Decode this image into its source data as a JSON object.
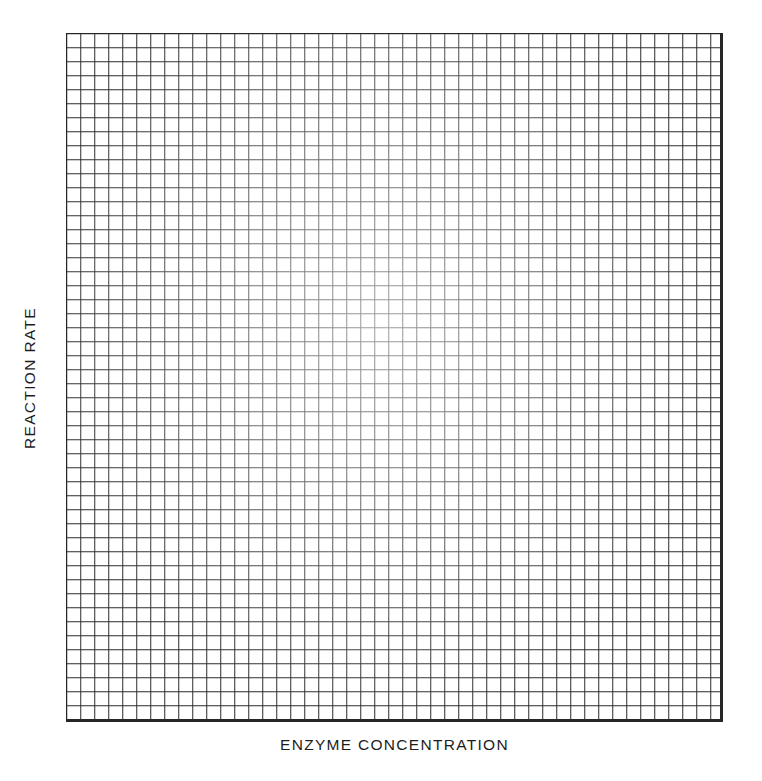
{
  "figure": {
    "kind": "blank-graph-paper",
    "background_color": "#ffffff"
  },
  "axes": {
    "y_label": "REACTION RATE",
    "x_label": "ENZYME CONCENTRATION",
    "label_color": "#1d1d1d"
  },
  "grid": {
    "line_color": "#2b2b2b",
    "border_color": "#262626",
    "cell_size_px": 14,
    "columns": 47,
    "rows": 49
  },
  "chart_data": {
    "type": "scatter",
    "title": "",
    "subtitle": "",
    "xlabel": "ENZYME CONCENTRATION",
    "ylabel": "REACTION RATE",
    "x": [],
    "values": [],
    "series": [],
    "categories": [],
    "xticklabels": [],
    "yticklabels": [],
    "xlim": [
      0,
      47
    ],
    "ylim": [
      0,
      49
    ],
    "grid": true,
    "legend": false,
    "legend_position": "none",
    "annotations": [],
    "note": "Blank ruled graph grid with labeled axes and no plotted data points."
  }
}
